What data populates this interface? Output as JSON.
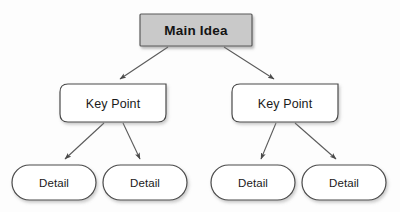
{
  "diagram": {
    "type": "hierarchy-tree",
    "background_color": "#fdfdfd",
    "nodes": {
      "root": {
        "label": "Main Idea",
        "shape": "rectangle",
        "fill": "#c9c9c9",
        "stroke": "#555555",
        "x": 140,
        "y": 14,
        "width": 112,
        "height": 32
      },
      "key_points": [
        {
          "label": "Key Point",
          "shape": "rounded-rectangle",
          "fill": "#ffffff",
          "stroke": "#444444",
          "x": 60,
          "y": 84,
          "width": 106,
          "height": 38
        },
        {
          "label": "Key Point",
          "shape": "rounded-rectangle",
          "fill": "#ffffff",
          "stroke": "#444444",
          "x": 232,
          "y": 84,
          "width": 106,
          "height": 38
        }
      ],
      "details": [
        {
          "label": "Detail",
          "shape": "pill",
          "fill": "#ffffff",
          "stroke": "#444444",
          "x": 12,
          "y": 165,
          "width": 84,
          "height": 35
        },
        {
          "label": "Detail",
          "shape": "pill",
          "fill": "#ffffff",
          "stroke": "#444444",
          "x": 103,
          "y": 165,
          "width": 84,
          "height": 35
        },
        {
          "label": "Detail",
          "shape": "pill",
          "fill": "#ffffff",
          "stroke": "#444444",
          "x": 211,
          "y": 165,
          "width": 84,
          "height": 35
        },
        {
          "label": "Detail",
          "shape": "pill",
          "fill": "#ffffff",
          "stroke": "#444444",
          "x": 302,
          "y": 165,
          "width": 84,
          "height": 35
        }
      ]
    },
    "connectors": [
      {
        "name": "root-to-key-point-left",
        "from": "root",
        "to": "key_point_left",
        "x1": 168,
        "y1": 47,
        "x2": 118,
        "y2": 81,
        "stroke": "#555555",
        "arrowhead": "solid-triangle"
      },
      {
        "name": "root-to-key-point-right",
        "from": "root",
        "to": "key_point_right",
        "x1": 224,
        "y1": 47,
        "x2": 276,
        "y2": 81,
        "stroke": "#555555",
        "arrowhead": "solid-triangle"
      },
      {
        "name": "key-point-left-to-detail-1",
        "from": "key_point_left",
        "to": "detail_1",
        "x1": 103,
        "y1": 123,
        "x2": 62,
        "y2": 161,
        "stroke": "#555555",
        "arrowhead": "solid-triangle"
      },
      {
        "name": "key-point-left-to-detail-2",
        "from": "key_point_left",
        "to": "detail_2",
        "x1": 123,
        "y1": 123,
        "x2": 141,
        "y2": 161,
        "stroke": "#555555",
        "arrowhead": "solid-triangle"
      },
      {
        "name": "key-point-right-to-detail-3",
        "from": "key_point_right",
        "to": "detail_3",
        "x1": 275,
        "y1": 123,
        "x2": 260,
        "y2": 161,
        "stroke": "#555555",
        "arrowhead": "solid-triangle"
      },
      {
        "name": "key-point-right-to-detail-4",
        "from": "key_point_right",
        "to": "detail_4",
        "x1": 296,
        "y1": 123,
        "x2": 339,
        "y2": 161,
        "stroke": "#555555",
        "arrowhead": "solid-triangle"
      }
    ]
  }
}
